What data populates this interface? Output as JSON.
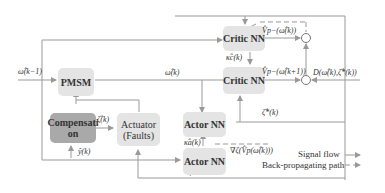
{
  "blocks": {
    "pmsm": "PMSM",
    "compensation_line1": "Compensati",
    "compensation_line2": "on",
    "actuator_line1": "Actuator",
    "actuator_line2": "(Faults)",
    "critic_top": "Critic NN",
    "critic_mid": "Critic NN",
    "actor_mid": "Actor NN",
    "actor_bot": "Actor NN"
  },
  "signals": {
    "omega_km1": "ω̂(k−1)",
    "omega_k": "ω̂(k)",
    "zeta_k": "ζ̂(k)",
    "y_k": "ŷ(k)",
    "kappa_c": "κ̂c(k)",
    "kappa_a": "κ̂a(k)",
    "v_top": "V̂p−(ω̂(k))",
    "v_mid": "V̂p−(ω̂(k+1))",
    "d_term": "D(ω̂(k),ζ̂*(k))",
    "zeta_star": "ζ̂*(k)",
    "grad": "∇ζ(V̂p(ω̂(k)))",
    "minus": "−",
    "plus": "+"
  },
  "legend": {
    "signal_flow": "Signal flow",
    "back_prop": "Back-propagating path"
  },
  "colors": {
    "light_box": "#e4e4e4",
    "dark_box": "#a9a9a9",
    "line": "#999999"
  }
}
